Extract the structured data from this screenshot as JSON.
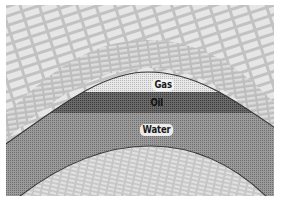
{
  "diagram": {
    "type": "anticline-petroleum-trap",
    "layers": [
      {
        "name": "caprock",
        "pattern": "brick",
        "fill": "#c8c8c8"
      },
      {
        "name": "gas",
        "label": "Gas",
        "fill": "#e4e4e4"
      },
      {
        "name": "oil",
        "label": "Oil",
        "fill": "#5a5a5a"
      },
      {
        "name": "water",
        "label": "Water",
        "fill": "#8c8c8c"
      },
      {
        "name": "base-rock",
        "pattern": "brick",
        "fill": "#d0d0d0"
      }
    ],
    "labels": {
      "gas": "Gas",
      "oil": "Oil",
      "water": "Water"
    },
    "colors": {
      "background": "#ffffff",
      "brick_fill": "#c4c4c4",
      "brick_line": "#ececec",
      "gas": "#e2e2e2",
      "oil": "#555555",
      "water": "#8a8a8a",
      "boundary": "#3a3a3a"
    }
  }
}
